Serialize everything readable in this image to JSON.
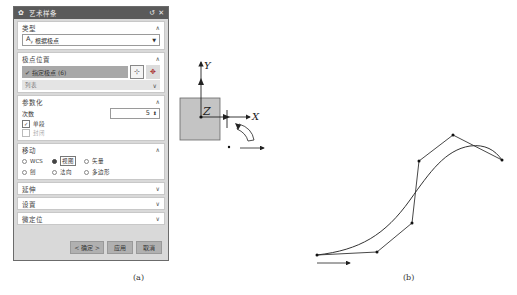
{
  "dialog": {
    "title": "艺术样条",
    "reset_icon": "↺",
    "close_icon": "✕",
    "sections": {
      "type": {
        "label": "类型",
        "value": "根据极点",
        "icon": "Aᵧ"
      },
      "pole_position": {
        "label": "极点位置",
        "select_label": "指定极点 (6)",
        "list_label": "列表"
      },
      "parameterization": {
        "label": "参数化",
        "degree_label": "次数",
        "degree_value": "5",
        "single_segment_label": "单段",
        "single_segment_checked": true,
        "closed_label": "封闭",
        "closed_checked": false
      },
      "move": {
        "label": "移动",
        "options": [
          {
            "label": "WCS",
            "selected": false
          },
          {
            "label": "视图",
            "selected": true
          },
          {
            "label": "矢量",
            "selected": false
          },
          {
            "label": "刨",
            "selected": false
          },
          {
            "label": "法向",
            "selected": false
          },
          {
            "label": "多边形",
            "selected": false
          }
        ]
      },
      "extension": {
        "label": "延伸"
      },
      "settings": {
        "label": "设置"
      },
      "micro_position": {
        "label": "微定位"
      }
    },
    "buttons": {
      "ok": "< 确定 >",
      "apply": "应用",
      "cancel": "取消"
    }
  },
  "triad": {
    "x_label": "X",
    "y_label": "Y",
    "z_label": "Z"
  },
  "curve": {
    "control_points": [
      [
        317,
        255
      ],
      [
        377,
        252
      ],
      [
        412,
        223
      ],
      [
        419,
        161
      ],
      [
        453,
        135
      ],
      [
        502,
        160
      ]
    ]
  },
  "captions": {
    "a": "(a)",
    "b": "(b)"
  }
}
